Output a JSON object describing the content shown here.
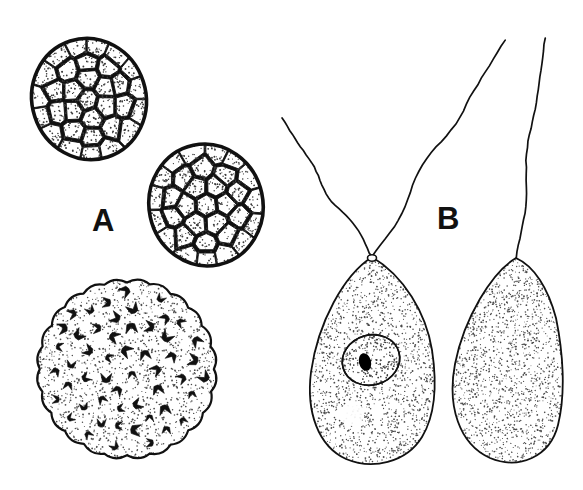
{
  "figure": {
    "background_color": "#ffffff",
    "ink_color": "#111111",
    "stipple_color": "#4a4a4a",
    "width": 583,
    "height": 490
  },
  "panels": [
    {
      "id": "A",
      "label": "A",
      "label_x": 92,
      "label_y": 205,
      "description": "Colonial stages: two cell-packed spheroid colonies and one large stippled disc colony containing biflagellate cells"
    },
    {
      "id": "B",
      "label": "B",
      "label_x": 437,
      "label_y": 203,
      "description": "Two pear-shaped flagellated cells, left with nucleus and nucleolus, right plain"
    }
  ],
  "chart_data": {
    "type": "diagram",
    "objects": [
      {
        "name": "colony-upper-left",
        "kind": "cellular-colony",
        "panel": "A",
        "center": [
          89,
          99
        ],
        "radius_x": 57,
        "radius_y": 61,
        "rotation_deg": -18,
        "cell_count": 34,
        "border_width": 3.6,
        "fill": "#ffffff",
        "stroke": "#111111",
        "stipple": true
      },
      {
        "name": "colony-middle",
        "kind": "cellular-colony",
        "panel": "A",
        "center": [
          206,
          205
        ],
        "radius_x": 57,
        "radius_y": 61,
        "rotation_deg": -12,
        "cell_count": 32,
        "border_width": 3.6,
        "fill": "#ffffff",
        "stroke": "#111111",
        "stipple": true
      },
      {
        "name": "disc-colony",
        "kind": "stippled-disc-colony",
        "panel": "A",
        "center": [
          127,
          369
        ],
        "radius": 91,
        "scallop_count": 24,
        "scallop_depth": 4,
        "border_width": 2.2,
        "stroke": "#111111",
        "stipple": true,
        "embedded_cell_count": 62,
        "embedded_cell_shape": "chevron"
      },
      {
        "name": "flagellate-cell-left",
        "kind": "flagellate-cell",
        "panel": "B",
        "apex": [
          372,
          257
        ],
        "body_bounds": [
          309,
          257,
          437,
          466
        ],
        "flagella_count": 2,
        "flagella_tips": [
          [
            282,
            118
          ],
          [
            505,
            40
          ]
        ],
        "nucleus": {
          "center": [
            371,
            360
          ],
          "radius_x": 29,
          "radius_y": 25,
          "rotation_deg": -16,
          "nucleolus": {
            "center": [
              365,
              362
            ],
            "radius_x": 6,
            "radius_y": 9,
            "fill": "#000000"
          }
        },
        "vacuole": {
          "center": [
            352,
            414
          ],
          "radius": 12
        },
        "stroke": "#111111",
        "border_width": 1.8,
        "stipple": true
      },
      {
        "name": "flagellate-cell-right",
        "kind": "flagellate-cell",
        "panel": "B",
        "apex": [
          516,
          258
        ],
        "body_bounds": [
          450,
          258,
          562,
          466
        ],
        "flagella_count": 1,
        "flagella_tips": [
          [
            545,
            38
          ]
        ],
        "nucleus": null,
        "vacuole": null,
        "stroke": "#111111",
        "border_width": 1.8,
        "stipple": true
      }
    ]
  }
}
